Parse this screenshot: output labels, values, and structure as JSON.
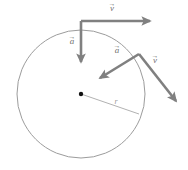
{
  "figure": {
    "colors": {
      "circle_stroke": "#9c9c9c",
      "radius_stroke": "#a8a8a8",
      "vector_stroke": "#808080",
      "center_dot": "#111111",
      "background": "#ffffff"
    },
    "circle": {
      "cx": 81,
      "cy": 94,
      "r": 64,
      "stroke_width": 1
    },
    "center_dot": {
      "cx": 81,
      "cy": 94,
      "r": 2.2
    },
    "radius": {
      "label": "r",
      "label_x": 116,
      "label_y": 104,
      "x1": 81,
      "y1": 94,
      "x2": 139,
      "y2": 114
    },
    "vectors": [
      {
        "name": "velocity-top",
        "label": "v",
        "accent": "→",
        "label_x": 112,
        "label_y": 11,
        "x1": 81,
        "y1": 21,
        "x2": 150,
        "y2": 21,
        "stroke_width": 2.6
      },
      {
        "name": "acceleration-top",
        "label": "a",
        "accent": "→",
        "label_x": 72,
        "label_y": 44,
        "x1": 81,
        "y1": 21,
        "x2": 81,
        "y2": 62,
        "stroke_width": 2.6
      },
      {
        "name": "velocity-right",
        "label": "v",
        "accent": "→",
        "label_x": 155,
        "label_y": 63,
        "x1": 139,
        "y1": 54,
        "x2": 176,
        "y2": 101,
        "stroke_width": 2.6
      },
      {
        "name": "acceleration-right",
        "label": "a",
        "accent": "→",
        "label_x": 117,
        "label_y": 53,
        "x1": 139,
        "y1": 54,
        "x2": 100,
        "y2": 78,
        "stroke_width": 2.6
      }
    ]
  }
}
